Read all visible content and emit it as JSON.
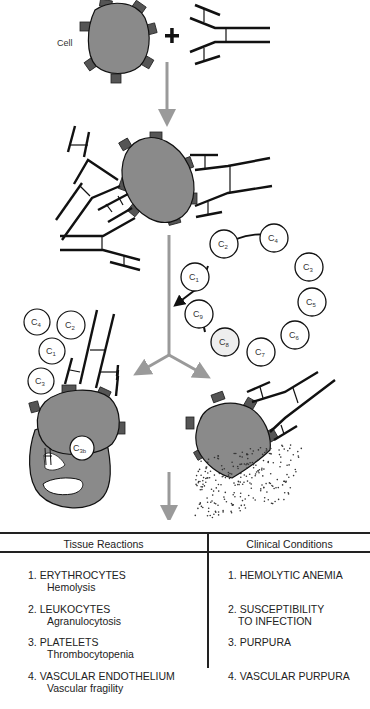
{
  "diagram": {
    "cell_label": "Cell",
    "plus_sign": "+",
    "complement_ring": [
      "C2",
      "C4",
      "C3",
      "C5",
      "C6",
      "C7",
      "C8",
      "C9",
      "C1"
    ],
    "free_components": [
      "C4",
      "C2",
      "C1",
      "C3"
    ],
    "bound_component": "C3b",
    "colors": {
      "cell_fill": "#8a8a8a",
      "receptor_fill": "#555555",
      "arrow": "#9a9a9a",
      "line": "#111111"
    }
  },
  "table": {
    "headers": {
      "left": "Tissue Reactions",
      "right": "Clinical Conditions"
    },
    "rows": [
      {
        "tissue": "1. ERYTHROCYTES",
        "reaction": "Hemolysis",
        "condition_1": "1. HEMOLYTIC ANEMIA",
        "condition_2": ""
      },
      {
        "tissue": "2. LEUKOCYTES",
        "reaction": "Agranulocytosis",
        "condition_1": "2. SUSCEPTIBILITY",
        "condition_2": "TO INFECTION"
      },
      {
        "tissue": "3. PLATELETS",
        "reaction": "Thrombocytopenia",
        "condition_1": "3. PURPURA",
        "condition_2": ""
      },
      {
        "tissue": "4. VASCULAR ENDOTHELIUM",
        "reaction": "Vascular fragility",
        "condition_1": "4. VASCULAR PURPURA",
        "condition_2": ""
      }
    ]
  }
}
